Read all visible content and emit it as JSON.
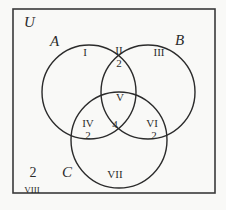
{
  "diagram": {
    "type": "venn-3-set",
    "universe_label": "U",
    "sets": [
      {
        "name": "A",
        "label": "A"
      },
      {
        "name": "B",
        "label": "B"
      },
      {
        "name": "C",
        "label": "C"
      }
    ],
    "regions": {
      "I": {
        "label": "I",
        "count": ""
      },
      "II": {
        "label": "II",
        "count": "2"
      },
      "III": {
        "label": "III",
        "count": ""
      },
      "IV": {
        "label": "IV",
        "count": "2"
      },
      "V": {
        "label": "V",
        "count": "4"
      },
      "VI": {
        "label": "VI",
        "count": "2"
      },
      "VII": {
        "label": "VII",
        "count": ""
      },
      "VIII": {
        "label": "VIII",
        "count": "2"
      }
    },
    "colors": {
      "line": "#2b2b2b",
      "background": "#f9f9f7"
    }
  }
}
